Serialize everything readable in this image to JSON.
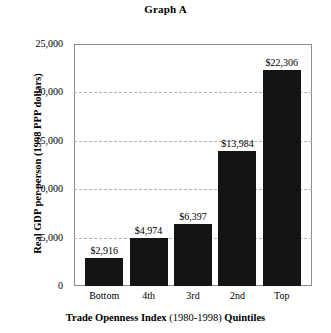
{
  "chart_data": {
    "type": "bar",
    "title": "Graph A",
    "xlabel": "Trade Openness Index (1980-1998) Quintiles",
    "xlabel_parts": {
      "lead": "Trade Openness Index",
      "period": "(1980-1998)",
      "trail": "Quintiles"
    },
    "ylabel": "Real GDP per person (1998 PPP dollars)",
    "categories": [
      "Bottom",
      "4th",
      "3rd",
      "2nd",
      "Top"
    ],
    "values": [
      2916,
      4974,
      6397,
      13984,
      22306
    ],
    "value_labels": [
      "$2,916",
      "$4,974",
      "$6,397",
      "$13,984",
      "$22,306"
    ],
    "ylim": [
      0,
      25000
    ],
    "ytick_values": [
      0,
      5000,
      10000,
      15000,
      20000,
      25000
    ],
    "ytick_labels": [
      "0",
      "5,000",
      "10,000",
      "15,000",
      "20,000",
      "25,000"
    ],
    "grid": true,
    "grid_style": "dashed",
    "legend": null,
    "bar_color": "#141414",
    "grid_color": "#b4b4b4",
    "frame_color": "#8c8c8c"
  }
}
